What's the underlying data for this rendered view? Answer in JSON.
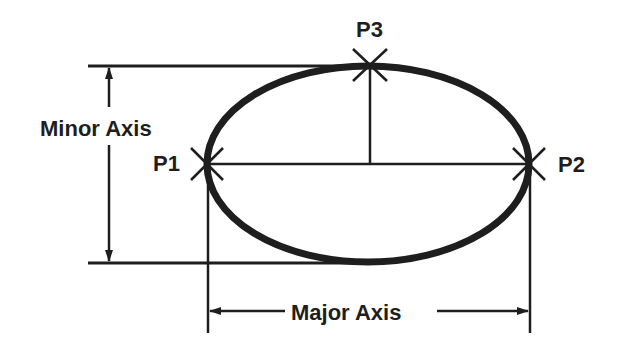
{
  "diagram": {
    "labels": {
      "minor_axis": "Minor Axis",
      "major_axis": "Major Axis",
      "p1": "P1",
      "p2": "P2",
      "p3": "P3"
    },
    "colors": {
      "stroke": "#1e1e1e",
      "background": "#ffffff"
    },
    "ellipse": {
      "cx": 368,
      "cy": 164,
      "rx": 161,
      "ry": 98
    },
    "points": [
      {
        "name": "P1",
        "x": 207,
        "y": 164
      },
      {
        "name": "P2",
        "x": 529,
        "y": 164
      },
      {
        "name": "P3",
        "x": 370,
        "y": 66
      }
    ]
  }
}
